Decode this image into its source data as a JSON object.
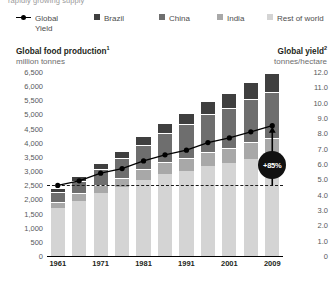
{
  "kicker": "rapidly growing supply",
  "legend": {
    "items": [
      {
        "label": "Global",
        "label2": "Yield",
        "type": "line",
        "color": "#000000",
        "name": "legend-global-yield"
      },
      {
        "label": "Brazil",
        "type": "swatch",
        "color": "#3f3f3f",
        "name": "legend-brazil"
      },
      {
        "label": "China",
        "type": "swatch",
        "color": "#6e6e6e",
        "name": "legend-china"
      },
      {
        "label": "India",
        "type": "swatch",
        "color": "#a8a8a8",
        "name": "legend-india"
      },
      {
        "label": "Rest of world",
        "type": "swatch",
        "color": "#d4d4d4",
        "name": "legend-rest-of-world"
      }
    ]
  },
  "left_heading": {
    "title": "Global food production",
    "sup": "1",
    "subtitle": "million tonnes"
  },
  "right_heading": {
    "title": "Global yield",
    "sup": "2",
    "subtitle": "tonnes/hectare"
  },
  "annotation": {
    "label": "+85%"
  },
  "chart_data": {
    "type": "bar",
    "title": "Global food production",
    "subtitle": "million tonnes",
    "xlabel": "",
    "ylabel": "million tonnes",
    "y2label": "tonnes/hectare",
    "ylim": [
      0,
      6500
    ],
    "y2lim": [
      0,
      12
    ],
    "yticks": [
      "0",
      "500",
      "1,000",
      "1,500",
      "2,000",
      "2,500",
      "3,000",
      "3,500",
      "4,000",
      "4,500",
      "5,000",
      "5,500",
      "6,000",
      "6,500"
    ],
    "y2ticks": [
      "0",
      "1.0",
      "2.0",
      "3.0",
      "4.0",
      "5.0",
      "6.0",
      "7.0",
      "8.0",
      "9.0",
      "10.0",
      "11.0",
      "12.0"
    ],
    "categories": [
      1961,
      1966,
      1971,
      1976,
      1981,
      1986,
      1991,
      1996,
      2001,
      2006,
      2009
    ],
    "xtick_labels": [
      "1961",
      "",
      "1971",
      "",
      "1981",
      "",
      "1991",
      "",
      "2001",
      "",
      "2009"
    ],
    "grid": false,
    "legend_position": "top",
    "series": [
      {
        "name": "Rest of world",
        "color": "#d4d4d4",
        "values": [
          1700,
          1960,
          2230,
          2430,
          2700,
          2890,
          3000,
          3170,
          3290,
          3420,
          3520
        ]
      },
      {
        "name": "India",
        "color": "#a8a8a8",
        "values": [
          180,
          215,
          255,
          290,
          330,
          380,
          430,
          470,
          500,
          560,
          610
        ]
      },
      {
        "name": "China",
        "color": "#6e6e6e",
        "values": [
          300,
          400,
          520,
          660,
          830,
          1010,
          1180,
          1320,
          1380,
          1500,
          1600
        ]
      },
      {
        "name": "Brazil",
        "color": "#3f3f3f",
        "values": [
          120,
          145,
          180,
          215,
          260,
          300,
          340,
          400,
          470,
          560,
          640
        ]
      }
    ],
    "line_series": {
      "name": "Global Yield",
      "color": "#000000",
      "axis": "right",
      "values": [
        4.6,
        4.9,
        5.4,
        5.7,
        6.2,
        6.6,
        6.9,
        7.4,
        7.7,
        8.1,
        8.5
      ]
    },
    "reference_line": {
      "value": 4.6,
      "axis": "right",
      "style": "dashed"
    },
    "annotation": {
      "text": "+85%",
      "at_category": 2009
    }
  }
}
